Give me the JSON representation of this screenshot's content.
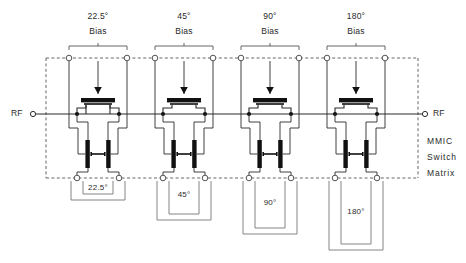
{
  "figure": {
    "type": "schematic",
    "block_label_lines": [
      "MMIC",
      "Switch",
      "Matrix"
    ],
    "colors": {
      "ink": "#1a1a1a",
      "wire": "#2b2b2b",
      "dashed_boundary": "#555555",
      "background": "#ffffff",
      "fet_fill": "#000000"
    }
  },
  "ports": {
    "left": {
      "label": "RF",
      "x": 31,
      "y": 114
    },
    "right": {
      "label": "RF",
      "x": 427,
      "y": 114
    }
  },
  "stages": [
    {
      "id": "stage-22p5",
      "bias_label_deg": "22.5°",
      "bias_label_word": "Bias",
      "delay_label": "22.5°",
      "bias_center_x": 98,
      "bias_terminal_x": [
        69,
        127
      ],
      "delay_depth": 22
    },
    {
      "id": "stage-45",
      "bias_label_deg": "45°",
      "bias_label_word": "Bias",
      "delay_label": "45°",
      "bias_center_x": 184,
      "bias_terminal_x": [
        155,
        213
      ],
      "delay_depth": 42
    },
    {
      "id": "stage-90",
      "bias_label_deg": "90°",
      "bias_label_word": "Bias",
      "delay_label": "90°",
      "bias_center_x": 270,
      "bias_terminal_x": [
        241,
        299
      ],
      "delay_depth": 56
    },
    {
      "id": "stage-180",
      "bias_label_deg": "180°",
      "bias_label_word": "Bias",
      "delay_label": "180°",
      "bias_center_x": 356,
      "bias_terminal_x": [
        327,
        385
      ],
      "delay_depth": 70
    }
  ],
  "geometry": {
    "boundary": {
      "x": 46,
      "y": 56,
      "w": 372,
      "h": 123
    },
    "top_rail_y": 58,
    "bottom_rail_y": 178,
    "rf_line_y": 114,
    "series_fet_gate_y": 100,
    "shunt_fet_y": 150
  }
}
